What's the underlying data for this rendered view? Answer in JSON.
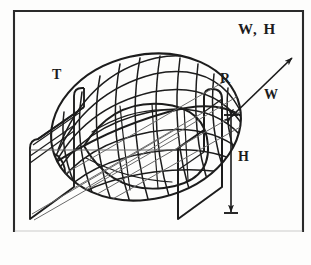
{
  "figure": {
    "background_color": "#fdfdfc",
    "ink_color": "#1c1c1c",
    "border": {
      "name": "figure-border",
      "color": "#2a2a2a",
      "style": "thin rectangular rule, open/faded along bottom edge"
    },
    "labels": {
      "caption": "W, H",
      "transmitter": "T",
      "receiver": "R",
      "width_dimension": "W",
      "height_dimension": "H"
    },
    "annotations": [
      {
        "name": "caption-w-h",
        "text": "W, H",
        "position": "top-right",
        "meaning": "labels for the two dimension arrows W and H"
      },
      {
        "name": "transmitter-label",
        "text": "T",
        "position": "upper-left, adjacent to left plate",
        "meaning": "transmitter plate"
      },
      {
        "name": "receiver-label",
        "text": "R",
        "position": "upper-right, adjacent to right plate",
        "meaning": "receiver plate"
      },
      {
        "name": "width-arrow-label",
        "text": "W",
        "position": "right side along diagonal arrow",
        "meaning": "width dimension of the plate, measured along the diagonal"
      },
      {
        "name": "height-arrow-label",
        "text": "H",
        "position": "right side along vertical arrow",
        "meaning": "height dimension of the plate, measured vertically"
      }
    ],
    "arrows": [
      {
        "name": "width-arrow",
        "orientation": "diagonal, pointing up and to the right",
        "heads": "double-headed",
        "label": "W"
      },
      {
        "name": "height-arrow",
        "orientation": "vertical",
        "heads": "double-headed with end ticks",
        "label": "H"
      }
    ],
    "objects": [
      {
        "name": "transmitter-plate",
        "description": "left rectangular plate drawn in oblique projection, rounded upper corner"
      },
      {
        "name": "receiver-plate",
        "description": "right rectangular plate drawn in oblique projection, rounded upper corner"
      },
      {
        "name": "ellipsoid-wireframe",
        "description": "egg/ellipsoid shaped mesh of meridian arcs and latitude cross-curves spanning between the two plates"
      }
    ]
  }
}
